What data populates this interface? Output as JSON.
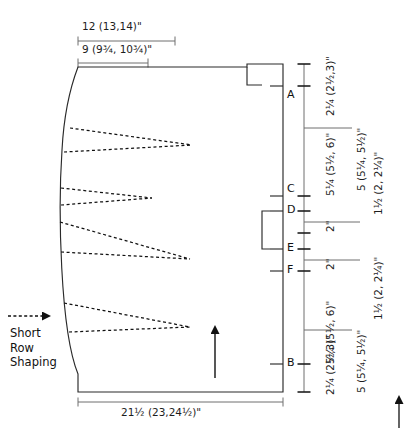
{
  "diagram": {
    "top_dimensions": [
      {
        "id": "top-upper",
        "text": "12 (13,14)\""
      },
      {
        "id": "top-lower",
        "text": "9 (9¾, 10¾)\""
      }
    ],
    "bottom_dimension": {
      "id": "bottom-width",
      "text": "21½ (23,24½)\""
    },
    "point_labels": [
      {
        "id": "A",
        "text": "A"
      },
      {
        "id": "C",
        "text": "C"
      },
      {
        "id": "D",
        "text": "D"
      },
      {
        "id": "E",
        "text": "E"
      },
      {
        "id": "F",
        "text": "F"
      },
      {
        "id": "B",
        "text": "B"
      }
    ],
    "inner_measurements": [
      {
        "id": "m-A-top",
        "text": "2¼ (2½,3)\""
      },
      {
        "id": "m-A-C",
        "text": "5¼ (5½, 6)\""
      },
      {
        "id": "m-C-D",
        "text": "2\""
      },
      {
        "id": "m-E-F",
        "text": "2\""
      },
      {
        "id": "m-F-B",
        "text": "5¼ (5½, 6)\""
      },
      {
        "id": "m-B-bottom",
        "text": "2¼ (2½,3)\""
      }
    ],
    "outer_measurements": [
      {
        "id": "o-top",
        "text": "5 (5¼, 5½)\""
      },
      {
        "id": "o-middle",
        "text": "1½ (2, 2¼)\""
      },
      {
        "id": "o-lower",
        "text": "1½ (2, 2¼)\""
      },
      {
        "id": "o-bottom",
        "text": "5 (5¼, 5½)\""
      }
    ],
    "annotation": {
      "id": "short-row-shaping",
      "line1": "Short",
      "line2": "Row",
      "line3": "Shaping"
    },
    "colors": {
      "ink": "#1a1a1a",
      "rule": "#6e6e6e",
      "background": "#ffffff"
    }
  }
}
